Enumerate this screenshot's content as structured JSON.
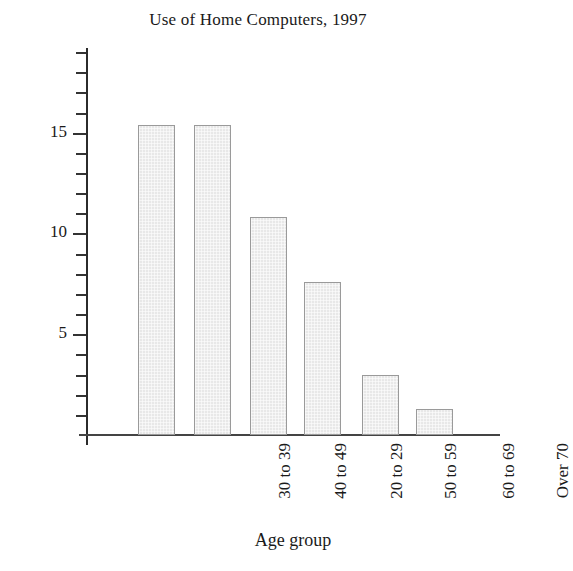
{
  "chart_data": {
    "type": "bar",
    "title": "Use of Home Computers, 1997",
    "xlabel": "Age group",
    "ylabel": "Number of people in millions",
    "categories": [
      "30 to 39",
      "40 to 49",
      "20 to 29",
      "50 to 59",
      "60 to 69",
      "Over 70"
    ],
    "values": [
      15.4,
      15.4,
      10.8,
      7.6,
      3.0,
      1.3
    ],
    "ylim": [
      0,
      19.2
    ],
    "xlim_note": "categorical",
    "y_major_ticks": [
      5,
      10,
      15
    ],
    "y_major_tick_labels": [
      "5",
      "10",
      "15"
    ],
    "y_minor_tick_interval": 1,
    "grid": false,
    "legend": "none",
    "colors": {
      "bar_fill": "#e8e8e8",
      "bar_border": "#9a9a9a",
      "axis": "#2b2b2b",
      "text": "#1a1a1a",
      "background": "#ffffff"
    }
  }
}
